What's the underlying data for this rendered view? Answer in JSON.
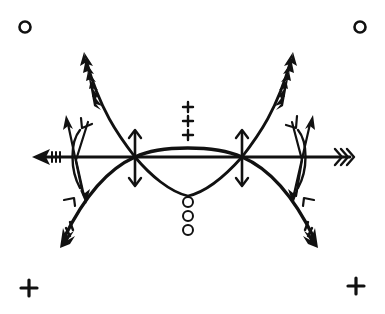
{
  "diagram": {
    "ink_color": "#111111",
    "background_color": "#ffffff",
    "corner_symbols": {
      "top_left": "circle",
      "top_right": "circle",
      "bottom_left": "plus",
      "bottom_right": "plus"
    },
    "center_top_marks": {
      "symbol": "plus",
      "count": 3
    },
    "center_bottom_marks": {
      "symbol": "circle",
      "count": 3
    },
    "elements": [
      {
        "name": "horizontal-arrow",
        "description": "Long horizontal arrow pointing left, fletched on the right"
      },
      {
        "name": "main-arc",
        "description": "Large arch ending in barbed arrowheads at both lower ends"
      },
      {
        "name": "lower-lens-curve",
        "description": "Downward curve between the two crossing points"
      },
      {
        "name": "upper-left-barbed-arrow",
        "description": "Barbed arrow rising up-left from left crossing"
      },
      {
        "name": "upper-right-barbed-arrow",
        "description": "Barbed arrow rising up-right from right crossing"
      },
      {
        "name": "left-double-arrow",
        "description": "Vertical double-headed arrow at left crossing"
      },
      {
        "name": "right-double-arrow",
        "description": "Vertical double-headed arrow at right crossing"
      },
      {
        "name": "left-bow",
        "description": "Small bow with crossed arrows at left"
      },
      {
        "name": "right-bow",
        "description": "Small bow with crossed arrows at right"
      }
    ]
  }
}
